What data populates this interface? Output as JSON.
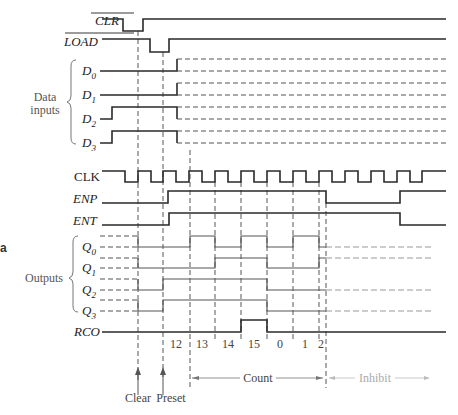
{
  "diagram": {
    "signals": {
      "clr": {
        "label": "CLR",
        "active_low": true
      },
      "load": {
        "label": "LOAD",
        "active_low": true
      },
      "d0": {
        "label": "D",
        "sub": "0"
      },
      "d1": {
        "label": "D",
        "sub": "1"
      },
      "d2": {
        "label": "D",
        "sub": "2"
      },
      "d3": {
        "label": "D",
        "sub": "3"
      },
      "clk": {
        "label": "CLK"
      },
      "enp": {
        "label": "ENP"
      },
      "ent": {
        "label": "ENT"
      },
      "q0": {
        "label": "Q",
        "sub": "0"
      },
      "q1": {
        "label": "Q",
        "sub": "1"
      },
      "q2": {
        "label": "Q",
        "sub": "2"
      },
      "q3": {
        "label": "Q",
        "sub": "3"
      },
      "rco": {
        "label": "RCO"
      }
    },
    "groups": {
      "data_inputs": {
        "line1": "Data",
        "line2": "inputs"
      },
      "outputs": {
        "label": "Outputs"
      }
    },
    "count_values": [
      "12",
      "13",
      "14",
      "15",
      "0",
      "1",
      "2"
    ],
    "annotations": {
      "clear": "Clear",
      "preset": "Preset",
      "count": "Count",
      "inhibit": "Inhibit"
    },
    "margin_mark": "a"
  }
}
